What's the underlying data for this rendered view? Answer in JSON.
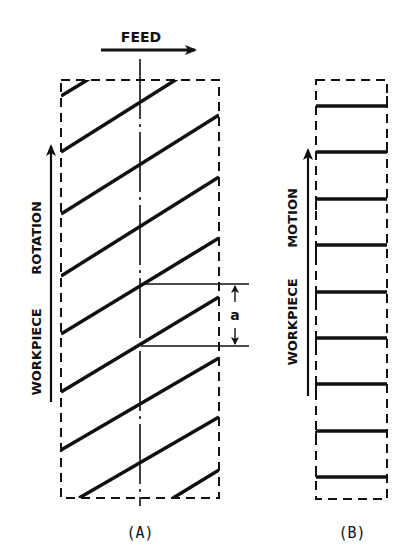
{
  "diagram": {
    "feed_label": "FEED",
    "panel_a": {
      "caption": "(A)",
      "side_label_1": "WORKPIECE",
      "side_label_2": "ROTATION",
      "dimension_label": "a",
      "description": "Helical (inclined) thread lines on workpiece surface with pitch dimension a"
    },
    "panel_b": {
      "caption": "(B)",
      "side_label_1": "WORKPIECE",
      "side_label_2": "MOTION",
      "description": "Parallel (circumferential) lines on workpiece surface"
    },
    "colors": {
      "ink": "#111111",
      "background": "#ffffff"
    }
  }
}
